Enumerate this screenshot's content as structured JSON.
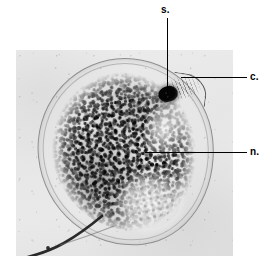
{
  "figure": {
    "kind": "photomicrograph",
    "plate_background_color": "#e8e8e8",
    "page_background_color": "#ffffff",
    "leader_line_color": "#000000"
  },
  "labels": [
    {
      "id": "stigma",
      "text": "s.",
      "leader": "vertical",
      "points_to": "dark eyespot at upper right of cell"
    },
    {
      "id": "cytostome",
      "text": "c.",
      "leader": "horizontal",
      "points_to": "collar / cytostome at upper right margin"
    },
    {
      "id": "nucleus",
      "text": "n.",
      "leader": "horizontal",
      "points_to": "pale nucleus in centre of cell"
    }
  ],
  "structures": {
    "cell_body": "ovoid cell outlined by a thin pellicle membrane",
    "cytoplasm": "dense dark granular cytoplasm filling most of the cell",
    "nucleus": "pale mottled rounded zone near the centre",
    "stigma": "small intensely dark spot",
    "reservoir": "clear groove beneath the stigma",
    "flagellum": "dark tapering tail emerging at lower left"
  }
}
